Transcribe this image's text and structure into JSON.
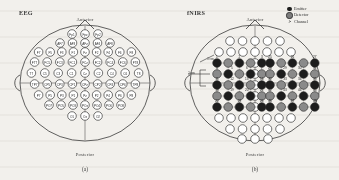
{
  "figure": {
    "caption_a": "(a)",
    "caption_b": "(b)",
    "bg_color": "#f2f0ec",
    "ink_color": "#2b2b2b"
  },
  "panel_a": {
    "title": "EEG",
    "anterior": "Anterior",
    "posterior": "Posterior",
    "electrode_count": 64,
    "rows": [
      {
        "y": 34,
        "labels": [
          "Fp1",
          "Fpz",
          "Fp2"
        ],
        "spacing": 13
      },
      {
        "y": 43,
        "labels": [
          "AF7",
          "AF3",
          "AFz",
          "AF4",
          "AF8"
        ],
        "spacing": 12.5
      },
      {
        "y": 52,
        "labels": [
          "F7",
          "F5",
          "F3",
          "F1",
          "Fz",
          "F2",
          "F4",
          "F6",
          "F8"
        ],
        "spacing": 11.6
      },
      {
        "y": 62,
        "labels": [
          "FT7",
          "FC5",
          "FC3",
          "FC1",
          "FCz",
          "FC2",
          "FC4",
          "FC6",
          "FT8"
        ],
        "spacing": 12.6
      },
      {
        "y": 73,
        "labels": [
          "T7",
          "C5",
          "C3",
          "C1",
          "Cz",
          "C2",
          "C4",
          "C6",
          "T8"
        ],
        "spacing": 13.4
      },
      {
        "y": 84,
        "labels": [
          "TP7",
          "CP5",
          "CP3",
          "CP1",
          "CPz",
          "CP2",
          "CP4",
          "CP6",
          "TP8"
        ],
        "spacing": 12.6
      },
      {
        "y": 95,
        "labels": [
          "P7",
          "P5",
          "P3",
          "P1",
          "Pz",
          "P2",
          "P4",
          "P6",
          "P8"
        ],
        "spacing": 11.6
      },
      {
        "y": 105,
        "labels": [
          "PO7",
          "PO5",
          "PO3",
          "POz",
          "PO4",
          "PO6",
          "PO8"
        ],
        "spacing": 12.0
      },
      {
        "y": 116,
        "labels": [
          "O1",
          "Oz",
          "O2"
        ],
        "spacing": 13
      }
    ]
  },
  "panel_b": {
    "title": "fNIRS",
    "anterior": "Anterior",
    "posterior": "Posterior",
    "legend": [
      {
        "marker": "emitter-dot",
        "label": "Emitter",
        "color": "#1d1d1d"
      },
      {
        "marker": "detector-dot",
        "label": "Detector",
        "color": "#7c7c7c"
      },
      {
        "marker": "channel-number",
        "label": "Channel",
        "color": "#1d1d1d"
      }
    ],
    "scale_labels": [
      "3 cm",
      "3 cm"
    ],
    "channel_count": 48,
    "left_grid_channels": [
      [
        1,
        2,
        3
      ],
      [
        4,
        5,
        6,
        7
      ],
      [
        11,
        12,
        13,
        14
      ],
      [
        18,
        19,
        20,
        21
      ],
      [
        22,
        23,
        24
      ]
    ],
    "right_grid_channels": [
      [
        25,
        26,
        27
      ],
      [
        28,
        29,
        30,
        31
      ],
      [
        32,
        33,
        34,
        35
      ],
      [
        42,
        43,
        44,
        45
      ],
      [
        46,
        47,
        48
      ]
    ],
    "optode_rows": 5,
    "optode_cols_per_side": 5
  }
}
